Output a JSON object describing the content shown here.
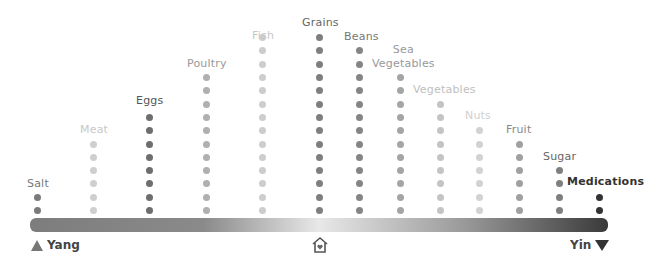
{
  "columns": [
    {
      "label": "Salt",
      "x": 37,
      "dots": 2,
      "color": "#7a7a7a",
      "text": "#777",
      "bold": false,
      "lx": 27,
      "ly": 177
    },
    {
      "label": "Meat",
      "x": 93,
      "dots": 6,
      "color": "#cfcfcf",
      "text": "#c8c8c8",
      "bold": false,
      "lx": 80,
      "ly": 123
    },
    {
      "label": "Eggs",
      "x": 149,
      "dots": 8,
      "color": "#6e6e6e",
      "text": "#555",
      "bold": false,
      "lx": 136,
      "ly": 94
    },
    {
      "label": "Poultry",
      "x": 206,
      "dots": 11,
      "color": "#b0b0b0",
      "text": "#999",
      "bold": false,
      "lx": 187,
      "ly": 57
    },
    {
      "label": "Fish",
      "x": 262,
      "dots": 14,
      "color": "#cdcdcd",
      "text": "#c8c8c8",
      "bold": false,
      "lx": 252,
      "ly": 29
    },
    {
      "label": "Grains",
      "x": 319,
      "dots": 14,
      "color": "#7f7f7f",
      "text": "#666",
      "bold": false,
      "lx": 302,
      "ly": 16
    },
    {
      "label": "Beans",
      "x": 359,
      "dots": 13,
      "color": "#858585",
      "text": "#777",
      "bold": false,
      "lx": 344,
      "ly": 30
    },
    {
      "label": "Sea\nVegetables",
      "x": 400,
      "dots": 11,
      "color": "#a5a5a5",
      "text": "#999",
      "bold": false,
      "lx": 372,
      "ly": 43
    },
    {
      "label": "Vegetables",
      "x": 440,
      "dots": 9,
      "color": "#c4c4c4",
      "text": "#c0c0c0",
      "bold": false,
      "lx": 413,
      "ly": 83
    },
    {
      "label": "Nuts",
      "x": 479,
      "dots": 7,
      "color": "#d2d2d2",
      "text": "#d0d0d0",
      "bold": false,
      "lx": 465,
      "ly": 109
    },
    {
      "label": "Fruit",
      "x": 519,
      "dots": 6,
      "color": "#a0a0a0",
      "text": "#888",
      "bold": false,
      "lx": 506,
      "ly": 123
    },
    {
      "label": "Sugar",
      "x": 559,
      "dots": 4,
      "color": "#7f7f7f",
      "text": "#666",
      "bold": false,
      "lx": 543,
      "ly": 150
    },
    {
      "label": "Medications",
      "x": 599,
      "dots": 2,
      "color": "#333333",
      "text": "#333",
      "bold": true,
      "lx": 567,
      "ly": 175
    }
  ],
  "axis": {
    "left_label": "Yang",
    "right_label": "Yin",
    "center_icon": "home-heart-icon"
  }
}
